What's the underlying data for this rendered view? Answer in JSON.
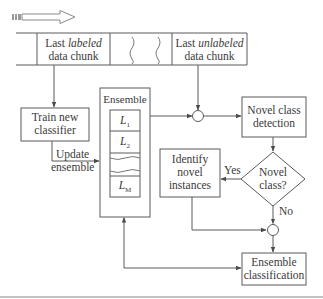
{
  "diagram": {
    "stream": {
      "labeled_chunk": {
        "prefix": "Last ",
        "emph": "labeled",
        "line2": "data chunk"
      },
      "unlabeled_chunk": {
        "prefix": "Last ",
        "emph": "unlabeled",
        "line2": "data chunk"
      }
    },
    "train": {
      "line1": "Train new",
      "line2": "classifier"
    },
    "update": {
      "line1": "Update",
      "line2": "ensemble"
    },
    "ensemble": {
      "title": "Ensemble",
      "models": [
        "L",
        "L",
        "L"
      ],
      "subscripts": [
        "1",
        "2",
        "M"
      ]
    },
    "detection": {
      "line1": "Novel class",
      "line2": "detection"
    },
    "decision": {
      "line1": "Novel",
      "line2": "class?",
      "yes": "Yes",
      "no": "No"
    },
    "identify": {
      "line1": "Identify",
      "line2": "novel",
      "line3": "instances"
    },
    "classification": {
      "line1": "Ensemble",
      "line2": "classification"
    },
    "colors": {
      "stroke": "#5a5a5a",
      "text": "#3a3a3a",
      "background": "#ffffff"
    }
  }
}
